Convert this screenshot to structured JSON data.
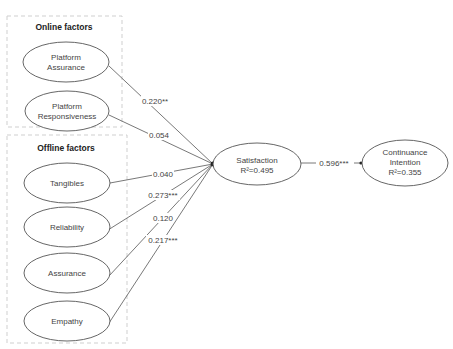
{
  "groups": {
    "online": {
      "title": "Online factors"
    },
    "offline": {
      "title": "Offline factors"
    }
  },
  "nodes": {
    "platform_assurance": {
      "line1": "Platform",
      "line2": "Assurance"
    },
    "platform_responsiveness": {
      "line1": "Platform",
      "line2": "Responsiveness"
    },
    "tangibles": {
      "label": "Tangibles"
    },
    "reliability": {
      "label": "Reliability"
    },
    "assurance": {
      "label": "Assurance"
    },
    "empathy": {
      "label": "Empathy"
    },
    "satisfaction": {
      "label": "Satisfaction",
      "r2": "R²=0.495"
    },
    "continuance_intention": {
      "line1": "Continuance",
      "line2": "Intention",
      "r2": "R²=0.355"
    }
  },
  "paths": {
    "platform_assurance_to_satisfaction": "0.220**",
    "platform_responsiveness_to_satisfaction": "0.054",
    "tangibles_to_satisfaction": "0.040",
    "reliability_to_satisfaction": "0.273***",
    "assurance_to_satisfaction": "0.120",
    "empathy_to_satisfaction": "0.217***",
    "satisfaction_to_continuance": "0.596***"
  },
  "colors": {
    "line": "#555555",
    "group_border": "#cfcfcf",
    "text": "#444444"
  }
}
